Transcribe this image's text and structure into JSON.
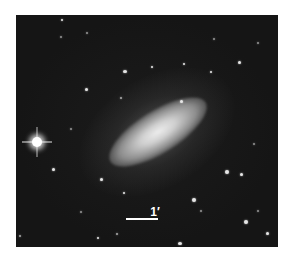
{
  "image": {
    "subject": "edge-on spiral galaxy",
    "scale_bar": {
      "label": "1′"
    },
    "colors": {
      "background": "#141414",
      "page": "#ffffff",
      "scale_bar": "#ffffff"
    }
  }
}
